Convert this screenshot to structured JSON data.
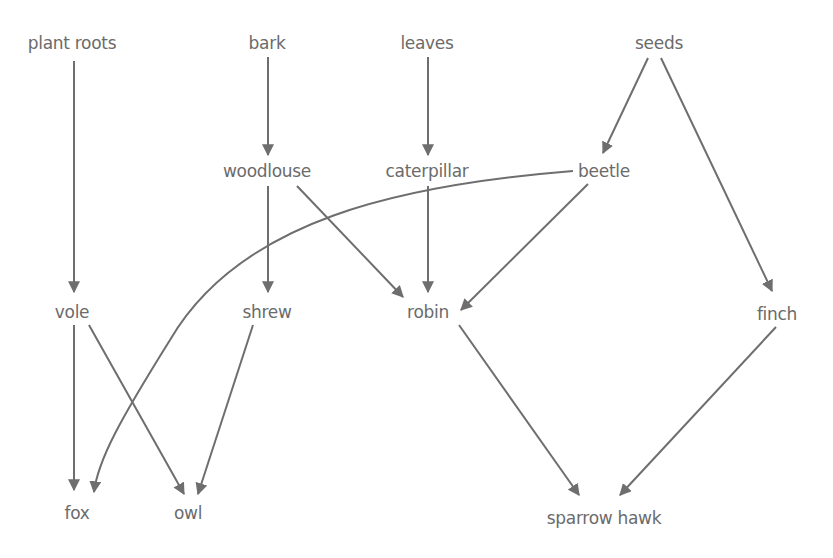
{
  "diagram": {
    "title": "",
    "type": "food-web",
    "colors": {
      "text": "#6b6b6b",
      "arrow": "#6e6e6e",
      "background": "#ffffff"
    },
    "nodes": {
      "plant_roots": {
        "label": "plant roots",
        "x": 72,
        "y": 49
      },
      "bark": {
        "label": "bark",
        "x": 267,
        "y": 49
      },
      "leaves": {
        "label": "leaves",
        "x": 427,
        "y": 49
      },
      "seeds": {
        "label": "seeds",
        "x": 659,
        "y": 49
      },
      "woodlouse": {
        "label": "woodlouse",
        "x": 267,
        "y": 177
      },
      "caterpillar": {
        "label": "caterpillar",
        "x": 427,
        "y": 177
      },
      "beetle": {
        "label": "beetle",
        "x": 604,
        "y": 177
      },
      "vole": {
        "label": "vole",
        "x": 72,
        "y": 318
      },
      "shrew": {
        "label": "shrew",
        "x": 267,
        "y": 318
      },
      "robin": {
        "label": "robin",
        "x": 428,
        "y": 318
      },
      "finch": {
        "label": "finch",
        "x": 777,
        "y": 320
      },
      "fox": {
        "label": "fox",
        "x": 77,
        "y": 519
      },
      "owl": {
        "label": "owl",
        "x": 188,
        "y": 519
      },
      "sparrow_hawk": {
        "label": "sparrow hawk",
        "x": 604,
        "y": 524
      }
    },
    "edges": [
      {
        "from": "plant roots",
        "to": "vole"
      },
      {
        "from": "bark",
        "to": "woodlouse"
      },
      {
        "from": "leaves",
        "to": "caterpillar"
      },
      {
        "from": "seeds",
        "to": "beetle"
      },
      {
        "from": "seeds",
        "to": "finch"
      },
      {
        "from": "woodlouse",
        "to": "shrew"
      },
      {
        "from": "woodlouse",
        "to": "robin"
      },
      {
        "from": "caterpillar",
        "to": "robin"
      },
      {
        "from": "beetle",
        "to": "robin"
      },
      {
        "from": "beetle",
        "to": "fox"
      },
      {
        "from": "vole",
        "to": "fox"
      },
      {
        "from": "vole",
        "to": "owl"
      },
      {
        "from": "shrew",
        "to": "owl"
      },
      {
        "from": "robin",
        "to": "sparrow hawk"
      },
      {
        "from": "finch",
        "to": "sparrow hawk"
      }
    ]
  }
}
